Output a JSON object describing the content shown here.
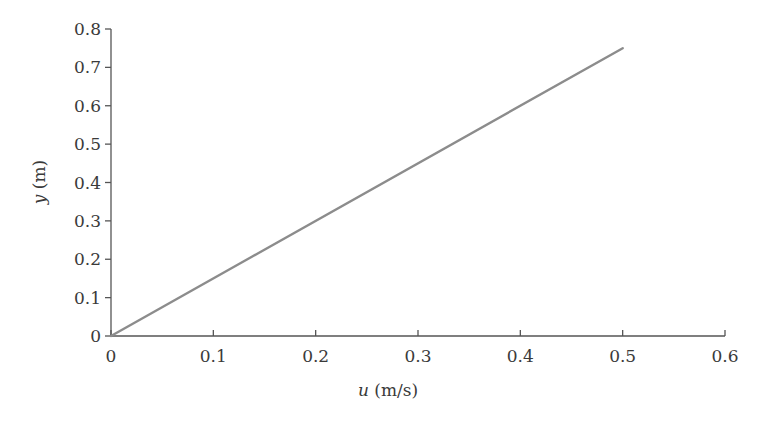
{
  "chart_data": {
    "type": "line",
    "title": "",
    "xlabel": "u (m/s)",
    "xlabel_var": "u",
    "xlabel_unit": " (m/s)",
    "ylabel": "y (m)",
    "ylabel_var": "y",
    "ylabel_unit": " (m)",
    "xlim": [
      0,
      0.6
    ],
    "ylim": [
      0,
      0.8
    ],
    "xticks": [
      "0",
      "0.1",
      "0.2",
      "0.3",
      "0.4",
      "0.5",
      "0.6"
    ],
    "yticks": [
      "0",
      "0.1",
      "0.2",
      "0.3",
      "0.4",
      "0.5",
      "0.6",
      "0.7",
      "0.8"
    ],
    "grid": false,
    "legend": null,
    "series": [
      {
        "name": "velocity profile",
        "color": "#8c8c8c",
        "x": [
          0,
          0.5
        ],
        "y": [
          0,
          0.75
        ]
      }
    ]
  },
  "colors": {
    "axis": "#555555",
    "line": "#8c8c8c",
    "text": "#3a3a3a"
  }
}
